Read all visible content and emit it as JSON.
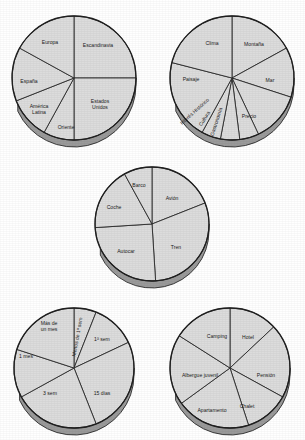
{
  "page": {
    "title": "Gráficos de sectores - Encuesta de viajes",
    "background_color": "#ffffff",
    "slice_fill_color": "#dcdcdc",
    "slice_edge_color": "#2b2b2b",
    "rim_shadow_color": "#9a9a9a",
    "label_color": "#1a1a1a"
  },
  "chart_data": [
    {
      "id": "destinos",
      "type": "pie",
      "title": "",
      "center": [
        74,
        78
      ],
      "radius": 62,
      "depth": 7,
      "start_angle": -90,
      "legend": "none",
      "categories": [
        "Escandinavia",
        "Estados Unidos",
        "Oriente",
        "América Latina",
        "España",
        "Europa"
      ],
      "values": [
        25,
        25,
        8,
        11,
        14,
        17
      ],
      "labels": [
        {
          "text": "Escandinavia",
          "lines": [
            "Escandinavia"
          ],
          "x": 98,
          "y": 46,
          "rotate": 0
        },
        {
          "text": "Estados Unidos",
          "lines": [
            "Estados",
            "Unidos"
          ],
          "x": 100,
          "y": 105,
          "rotate": 0
        },
        {
          "text": "Oriente",
          "lines": [
            "Oriente"
          ],
          "x": 66,
          "y": 128,
          "rotate": 0
        },
        {
          "text": "América Latina",
          "lines": [
            "América",
            "Latina"
          ],
          "x": 39,
          "y": 110,
          "rotate": 0
        },
        {
          "text": "España",
          "lines": [
            "España"
          ],
          "x": 29,
          "y": 82,
          "rotate": 0
        },
        {
          "text": "Europa",
          "lines": [
            "Europa"
          ],
          "x": 50,
          "y": 43,
          "rotate": 0
        }
      ]
    },
    {
      "id": "motivos",
      "type": "pie",
      "title": "",
      "center": [
        232,
        78
      ],
      "radius": 62,
      "depth": 7,
      "start_angle": -90,
      "legend": "none",
      "categories": [
        "Montaña",
        "Mar",
        "Precio",
        "Gastronomía",
        "Cultura",
        "Interés Histórico",
        "Paisaje",
        "Clima"
      ],
      "values": [
        17,
        13,
        13,
        5,
        5,
        5,
        21,
        21
      ],
      "labels": [
        {
          "text": "Montaña",
          "lines": [
            "Montaña"
          ],
          "x": 254,
          "y": 45,
          "rotate": 0
        },
        {
          "text": "Mar",
          "lines": [
            "Mar"
          ],
          "x": 270,
          "y": 81,
          "rotate": 0
        },
        {
          "text": "Precio",
          "lines": [
            "Precio"
          ],
          "x": 249,
          "y": 117,
          "rotate": 0
        },
        {
          "text": "Gastronomía",
          "lines": [
            "Gastronomía"
          ],
          "x": 217,
          "y": 122,
          "rotate": -72
        },
        {
          "text": "Cultura",
          "lines": [
            "Cultura"
          ],
          "x": 205,
          "y": 119,
          "rotate": -58
        },
        {
          "text": "Interés Histórico",
          "lines": [
            "Interés Histórico"
          ],
          "x": 195,
          "y": 112,
          "rotate": -42
        },
        {
          "text": "Paisaje",
          "lines": [
            "Paisaje"
          ],
          "x": 191,
          "y": 80,
          "rotate": 0
        },
        {
          "text": "Clima",
          "lines": [
            "Clima"
          ],
          "x": 212,
          "y": 44,
          "rotate": 0
        }
      ]
    },
    {
      "id": "transporte",
      "type": "pie",
      "title": "",
      "center": [
        152,
        224
      ],
      "radius": 57,
      "depth": 7,
      "start_angle": -90,
      "legend": "none",
      "categories": [
        "Avión",
        "Tren",
        "Autocar",
        "Coche",
        "Barco"
      ],
      "values": [
        19,
        30,
        25,
        18,
        8
      ],
      "labels": [
        {
          "text": "Avión",
          "lines": [
            "Avión"
          ],
          "x": 172,
          "y": 199,
          "rotate": 0
        },
        {
          "text": "Tren",
          "lines": [
            "Tren"
          ],
          "x": 176,
          "y": 248,
          "rotate": 0
        },
        {
          "text": "Autocar",
          "lines": [
            "Autocar"
          ],
          "x": 126,
          "y": 252,
          "rotate": 0
        },
        {
          "text": "Coche",
          "lines": [
            "Coche"
          ],
          "x": 114,
          "y": 208,
          "rotate": 0
        },
        {
          "text": "Barco",
          "lines": [
            "Barco"
          ],
          "x": 139,
          "y": 186,
          "rotate": 0
        }
      ]
    },
    {
      "id": "duracion",
      "type": "pie",
      "title": "",
      "center": [
        74,
        368
      ],
      "radius": 60,
      "depth": 7,
      "start_angle": -90,
      "legend": "none",
      "categories": [
        "Menos de 1ª sem",
        "1ª sem",
        "15 días",
        "3 sem",
        "1 mes",
        "Más de un mes"
      ],
      "values": [
        6,
        12,
        26,
        23,
        13,
        20
      ],
      "labels": [
        {
          "text": "Menos de 1ª sem",
          "lines": [
            "Menos de 1ª sem"
          ],
          "x": 78,
          "y": 337,
          "rotate": -80
        },
        {
          "text": "1ª sem",
          "lines": [
            "1ª sem"
          ],
          "x": 102,
          "y": 340,
          "rotate": 0
        },
        {
          "text": "15 días",
          "lines": [
            "15 días"
          ],
          "x": 102,
          "y": 394,
          "rotate": 0
        },
        {
          "text": "3 sem",
          "lines": [
            "3 sem"
          ],
          "x": 50,
          "y": 394,
          "rotate": 0
        },
        {
          "text": "1 mes",
          "lines": [
            "1 mes"
          ],
          "x": 26,
          "y": 357,
          "rotate": 0
        },
        {
          "text": "Más de un mes",
          "lines": [
            "Más de",
            "un mes"
          ],
          "x": 49,
          "y": 327,
          "rotate": 0
        }
      ]
    },
    {
      "id": "alojamiento",
      "type": "pie",
      "title": "",
      "center": [
        230,
        368
      ],
      "radius": 60,
      "depth": 7,
      "start_angle": -90,
      "legend": "none",
      "categories": [
        "Hotel",
        "Pensión",
        "Chalet",
        "Apartamento",
        "Albergue juvenil",
        "Camping"
      ],
      "values": [
        13,
        20,
        12,
        20,
        19,
        16
      ],
      "labels": [
        {
          "text": "Hotel",
          "lines": [
            "Hotel"
          ],
          "x": 248,
          "y": 338,
          "rotate": 0
        },
        {
          "text": "Pensión",
          "lines": [
            "Pensión"
          ],
          "x": 266,
          "y": 376,
          "rotate": 0
        },
        {
          "text": "Chalet",
          "lines": [
            "Chalet"
          ],
          "x": 247,
          "y": 407,
          "rotate": 0
        },
        {
          "text": "Apartamento",
          "lines": [
            "Apartamento"
          ],
          "x": 212,
          "y": 411,
          "rotate": 0
        },
        {
          "text": "Albergue juvenil",
          "lines": [
            "Albergue juvenil"
          ],
          "x": 200,
          "y": 376,
          "rotate": 0
        },
        {
          "text": "Camping",
          "lines": [
            "Camping"
          ],
          "x": 217,
          "y": 337,
          "rotate": 0
        }
      ]
    }
  ]
}
